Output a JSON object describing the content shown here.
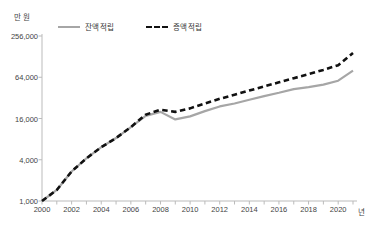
{
  "chart_data": {
    "type": "line",
    "title": "",
    "xlabel": "년",
    "ylabel": "만 원",
    "yscale": "log4",
    "ylim": [
      1000,
      256000
    ],
    "xlim": [
      2000,
      2021
    ],
    "grid": false,
    "legend_position": "top-left",
    "ytick_labels": [
      "256,000",
      "64,000",
      "16,000",
      "4,000",
      "1,000"
    ],
    "ytick_values": [
      256000,
      64000,
      16000,
      4000,
      1000
    ],
    "xtick_labels": [
      "2000",
      "2002",
      "2004",
      "2006",
      "2008",
      "2010",
      "2012",
      "2014",
      "2016",
      "2018",
      "2020"
    ],
    "xtick_values": [
      2000,
      2002,
      2004,
      2006,
      2008,
      2010,
      2012,
      2014,
      2016,
      2018,
      2020
    ],
    "x": [
      2000,
      2001,
      2002,
      2003,
      2004,
      2005,
      2006,
      2007,
      2008,
      2009,
      2010,
      2011,
      2012,
      2013,
      2014,
      2015,
      2016,
      2017,
      2018,
      2019,
      2020,
      2021
    ],
    "series": [
      {
        "name": "잔액 적립",
        "style": "solid",
        "color": "#a6a6a6",
        "values": [
          1000,
          1450,
          2700,
          4200,
          6100,
          8300,
          12000,
          17500,
          20000,
          15500,
          17200,
          20500,
          24000,
          26500,
          30000,
          34000,
          38000,
          43000,
          46000,
          50000,
          57000,
          80000
        ]
      },
      {
        "name": "증액 적립",
        "style": "dashed",
        "color": "#111111",
        "values": [
          1000,
          1450,
          2700,
          4200,
          6100,
          8300,
          12000,
          18200,
          21500,
          20000,
          22500,
          26500,
          31000,
          35500,
          41000,
          47000,
          54000,
          62000,
          71000,
          82000,
          96000,
          145000
        ]
      }
    ]
  },
  "axis": {
    "y_unit": "만 원",
    "x_unit": "년"
  }
}
